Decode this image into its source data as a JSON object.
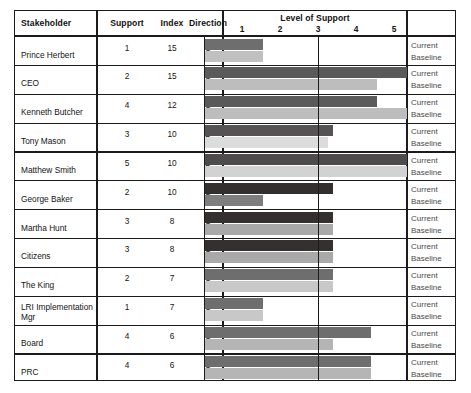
{
  "table": {
    "columns": {
      "stakeholder": "Stakeholder",
      "support": "Support",
      "index": "Index",
      "direction": "Direction",
      "chart_header": "Level of Support"
    },
    "series_labels": {
      "current": "Current",
      "baseline": "Baseline"
    },
    "axis_ticks": [
      "1",
      "2",
      "3",
      "4",
      "5"
    ],
    "rows": [
      {
        "stakeholder": "Prince Herbert",
        "support": "1",
        "index": "15",
        "direction": "U",
        "current": 1.55,
        "baseline": 1.55
      },
      {
        "stakeholder": "CEO",
        "support": "2",
        "index": "15",
        "direction": "U",
        "current": 5.35,
        "baseline": 4.55
      },
      {
        "stakeholder": "Kenneth Butcher",
        "support": "4",
        "index": "12",
        "direction": "U",
        "current": 4.55,
        "baseline": 5.35
      },
      {
        "stakeholder": "Tony Mason",
        "support": "3",
        "index": "10",
        "direction": "D",
        "current": 3.4,
        "baseline": 3.25
      },
      {
        "stakeholder": "Matthew Smith",
        "support": "5",
        "index": "10",
        "direction": "D",
        "current": 5.35,
        "baseline": 5.35
      },
      {
        "stakeholder": "George Baker",
        "support": "2",
        "index": "10",
        "direction": "S",
        "current": 3.4,
        "baseline": 1.55
      },
      {
        "stakeholder": "Martha Hunt",
        "support": "3",
        "index": "8",
        "direction": "O",
        "current": 3.4,
        "baseline": 3.4
      },
      {
        "stakeholder": "Citizens",
        "support": "3",
        "index": "8",
        "direction": "O",
        "current": 3.4,
        "baseline": 3.4
      },
      {
        "stakeholder": "The King",
        "support": "2",
        "index": "7",
        "direction": "U",
        "current": 3.4,
        "baseline": 3.4
      },
      {
        "stakeholder": "LRI Implementation\nMgr",
        "support": "1",
        "index": "7",
        "direction": "U",
        "current": 1.55,
        "baseline": 1.55
      },
      {
        "stakeholder": "Board",
        "support": "4",
        "index": "6",
        "direction": "U",
        "current": 4.4,
        "baseline": 3.4
      },
      {
        "stakeholder": "PRC",
        "support": "4",
        "index": "6",
        "direction": "U",
        "current": 4.4,
        "baseline": 4.4
      }
    ],
    "row_bar_shades": {
      "current": [
        "#6e6e6e",
        "#5a5a5a",
        "#5a5a5a",
        "#555353",
        "#4d4b4b",
        "#332f2f",
        "#343030",
        "#343030",
        "#6e6e6e",
        "#6e6e6e",
        "#6e6e6e",
        "#6e6e6e"
      ],
      "baseline": [
        "#c0c0c0",
        "#bdbdbd",
        "#bdbdbd",
        "#dcdcdc",
        "#d2d2d2",
        "#7e7e7e",
        "#a9a9a9",
        "#a9a9a9",
        "#c8c8c8",
        "#c8c8c8",
        "#b5b5b5",
        "#b5b5b5"
      ]
    }
  },
  "chart_data": {
    "type": "bar",
    "title": "Level of Support",
    "xlabel": "Level of Support",
    "ylabel": "Stakeholder",
    "xlim": [
      0,
      5.35
    ],
    "xticks": [
      1,
      2,
      3,
      4,
      5
    ],
    "grid": true,
    "orientation": "horizontal",
    "legend": [
      "Current",
      "Baseline"
    ],
    "categories": [
      "Prince Herbert",
      "CEO",
      "Kenneth Butcher",
      "Tony Mason",
      "Matthew Smith",
      "George Baker",
      "Martha Hunt",
      "Citizens",
      "The King",
      "LRI Implementation Mgr",
      "Board",
      "PRC"
    ],
    "series": [
      {
        "name": "Current",
        "values": [
          1.5,
          5.3,
          4.5,
          3.4,
          5.3,
          3.4,
          3.4,
          3.4,
          3.4,
          1.5,
          4.4,
          4.4
        ]
      },
      {
        "name": "Baseline",
        "values": [
          1.5,
          4.5,
          5.3,
          3.2,
          5.3,
          1.5,
          3.4,
          3.4,
          3.4,
          1.5,
          3.4,
          4.4
        ]
      }
    ],
    "support": [
      1,
      2,
      4,
      3,
      5,
      2,
      3,
      3,
      2,
      1,
      4,
      4
    ],
    "index": [
      15,
      15,
      12,
      10,
      10,
      10,
      8,
      8,
      7,
      7,
      6,
      6
    ],
    "direction": [
      "U",
      "U",
      "U",
      "D",
      "D",
      "S",
      "O",
      "O",
      "U",
      "U",
      "U",
      "U"
    ]
  }
}
